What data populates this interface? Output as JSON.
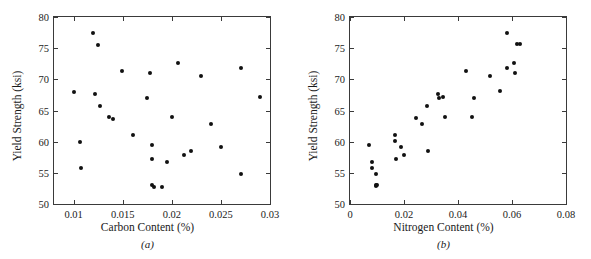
{
  "figure": {
    "panels": [
      {
        "id": "a",
        "caption": "(a)",
        "xlabel": "Carbon Content (%)",
        "ylabel": "Yield Strength (ksi)",
        "xticks": [
          "0.01",
          "0.015",
          "0.02",
          "0.025",
          "0.03"
        ],
        "xtickvals": [
          0.01,
          0.015,
          0.02,
          0.025,
          0.03
        ],
        "yticks": [
          "50",
          "55",
          "60",
          "65",
          "70",
          "75",
          "80"
        ],
        "ytickvals": [
          50,
          55,
          60,
          65,
          70,
          75,
          80
        ]
      },
      {
        "id": "b",
        "caption": "(b)",
        "xlabel": "Nitrogen Content (%)",
        "ylabel": "Yield Strength (ksi)",
        "xticks": [
          "0",
          "0.02",
          "0.04",
          "0.06",
          "0.08"
        ],
        "xtickvals": [
          0,
          0.02,
          0.04,
          0.06,
          0.08
        ],
        "yticks": [
          "50",
          "55",
          "60",
          "65",
          "70",
          "75",
          "80"
        ],
        "ytickvals": [
          50,
          55,
          60,
          65,
          70,
          75,
          80
        ]
      }
    ]
  },
  "chart_data": [
    {
      "type": "scatter",
      "title": "",
      "panel": "(a)",
      "xlabel": "Carbon Content (%)",
      "ylabel": "Yield Strength (ksi)",
      "xlim": [
        0.008,
        0.03
      ],
      "ylim": [
        50,
        80
      ],
      "grid": false,
      "legend": "none",
      "marker": "filled-circle",
      "marker_color": "#111111",
      "x": [
        0.01,
        0.0106,
        0.0107,
        0.012,
        0.0122,
        0.0125,
        0.0127,
        0.0136,
        0.014,
        0.0149,
        0.016,
        0.0175,
        0.0178,
        0.018,
        0.018,
        0.018,
        0.0182,
        0.019,
        0.0195,
        0.02,
        0.0206,
        0.0212,
        0.022,
        0.023,
        0.024,
        0.025,
        0.027,
        0.027,
        0.029
      ],
      "y": [
        67.9,
        60.0,
        55.7,
        77.4,
        67.6,
        75.5,
        65.8,
        64.0,
        63.7,
        71.4,
        61.0,
        67.0,
        71.0,
        59.5,
        57.2,
        53.1,
        52.8,
        52.8,
        56.7,
        64.0,
        72.7,
        57.8,
        58.5,
        70.6,
        62.8,
        59.1,
        71.8,
        54.8,
        67.1
      ]
    },
    {
      "type": "scatter",
      "title": "",
      "panel": "(b)",
      "xlabel": "Nitrogen Content (%)",
      "ylabel": "Yield Strength (ksi)",
      "xlim": [
        0,
        0.08
      ],
      "ylim": [
        50,
        80
      ],
      "grid": false,
      "legend": "none",
      "marker": "filled-circle",
      "marker_color": "#111111",
      "x": [
        0.0072,
        0.008,
        0.0082,
        0.0095,
        0.0096,
        0.0098,
        0.01,
        0.0165,
        0.0168,
        0.017,
        0.019,
        0.02,
        0.0243,
        0.0265,
        0.0285,
        0.029,
        0.0325,
        0.033,
        0.0345,
        0.0352,
        0.043,
        0.045,
        0.0458,
        0.052,
        0.0555,
        0.058,
        0.0582,
        0.0608,
        0.0612,
        0.062,
        0.0628
      ],
      "y": [
        59.5,
        55.7,
        56.7,
        52.9,
        53.1,
        54.8,
        53.0,
        61.0,
        60.1,
        57.2,
        59.1,
        57.8,
        63.8,
        62.8,
        65.8,
        58.5,
        67.6,
        67.0,
        67.1,
        64.0,
        71.4,
        64.0,
        67.0,
        70.6,
        68.1,
        77.5,
        71.8,
        72.7,
        71.0,
        75.6,
        75.6
      ]
    }
  ]
}
